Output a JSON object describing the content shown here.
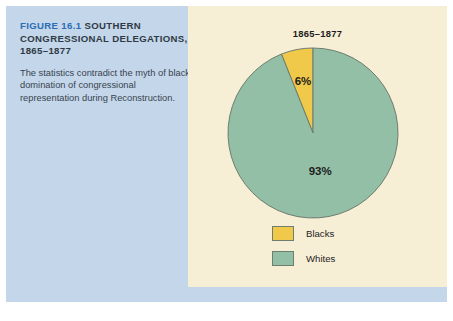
{
  "figure": {
    "label": "FIGURE 16.1",
    "title_rest": "SOUTHERN CONGRESSIONAL DELEGATIONS, 1865–1877",
    "caption": "The statistics contradict the myth of black domination of congressional representation during Reconstruction."
  },
  "colors": {
    "panel_background": "#c3d6ea",
    "chart_background": "#f7eed6",
    "figure_label": "#2b6cb5",
    "blacks": "#f0c84a",
    "whites": "#92bfa5",
    "slice_outline": "#6f7d6e",
    "text": "#1d1d1d"
  },
  "chart_data": {
    "type": "pie",
    "title": "1865–1877",
    "categories": [
      "Blacks",
      "Whites"
    ],
    "values": [
      6,
      93
    ],
    "data_labels": [
      "6%",
      "93%"
    ],
    "colors": [
      "#f0c84a",
      "#92bfa5"
    ],
    "legend": [
      {
        "label": "Blacks",
        "color": "#f0c84a"
      },
      {
        "label": "Whites",
        "color": "#92bfa5"
      }
    ],
    "legend_position": "bottom",
    "start_angle_deg": 0,
    "direction": "counterclockwise",
    "units": "percent"
  }
}
